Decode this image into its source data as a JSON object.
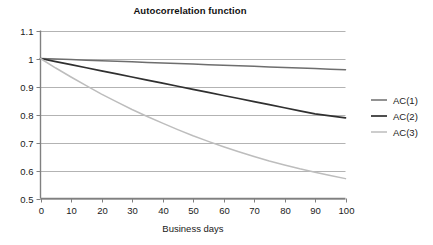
{
  "chart_data": {
    "type": "line",
    "title": "Autocorrelation function",
    "xlabel": "Business days",
    "ylabel": "",
    "xlim": [
      0,
      100
    ],
    "ylim": [
      0.5,
      1.1
    ],
    "grid": "horizontal",
    "legend_position": "right",
    "xticks": [
      0,
      10,
      20,
      30,
      40,
      50,
      60,
      70,
      80,
      90,
      100
    ],
    "xtick_labels": [
      "0",
      "10",
      "20",
      "30",
      "40",
      "50",
      "60",
      "70",
      "80",
      "90",
      "100"
    ],
    "yticks": [
      0.5,
      0.6,
      0.7,
      0.8,
      0.9,
      1.0,
      1.1
    ],
    "ytick_labels": [
      "0.5",
      "0.6",
      "0.7",
      "0.8",
      "0.9",
      "1",
      "1.1"
    ],
    "x": [
      0,
      5,
      10,
      15,
      20,
      25,
      30,
      35,
      40,
      45,
      50,
      55,
      60,
      65,
      70,
      75,
      80,
      85,
      90,
      95,
      100
    ],
    "series": [
      {
        "name": "AC(1)",
        "color": "#6e6e6e",
        "values": [
          1.0,
          0.998,
          0.996,
          0.994,
          0.992,
          0.99,
          0.988,
          0.986,
          0.984,
          0.982,
          0.98,
          0.978,
          0.976,
          0.974,
          0.972,
          0.97,
          0.968,
          0.966,
          0.964,
          0.962,
          0.96
        ]
      },
      {
        "name": "AC(2)",
        "color": "#303030",
        "values": [
          1.0,
          0.989,
          0.978,
          0.967,
          0.956,
          0.945,
          0.934,
          0.923,
          0.912,
          0.901,
          0.89,
          0.879,
          0.868,
          0.857,
          0.846,
          0.835,
          0.824,
          0.813,
          0.802,
          0.795,
          0.788
        ]
      },
      {
        "name": "AC(3)",
        "color": "#bdbdbd",
        "values": [
          1.0,
          0.966,
          0.934,
          0.903,
          0.873,
          0.845,
          0.818,
          0.793,
          0.769,
          0.746,
          0.724,
          0.704,
          0.685,
          0.667,
          0.65,
          0.634,
          0.62,
          0.606,
          0.594,
          0.582,
          0.571
        ]
      }
    ]
  },
  "legend": {
    "items": [
      {
        "label": "AC(1)"
      },
      {
        "label": "AC(2)"
      },
      {
        "label": "AC(3)"
      }
    ]
  },
  "axes": {
    "x_title": "Business days"
  },
  "colors": {
    "axis": "#808080",
    "gridline": "#b3b3b3",
    "text": "#1a1a1a",
    "background": "#ffffff"
  }
}
